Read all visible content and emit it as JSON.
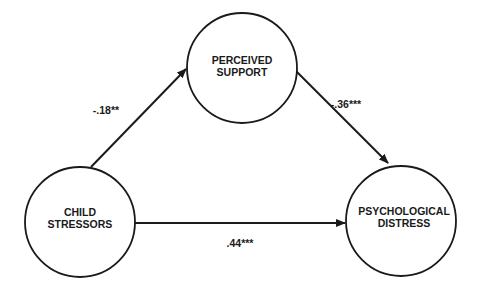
{
  "diagram": {
    "type": "mediation-path-model",
    "nodes": [
      {
        "id": "perceived_support",
        "line1": "PERCEIVED",
        "line2": "SUPPORT"
      },
      {
        "id": "child_stressors",
        "line1": "CHILD",
        "line2": "STRESSORS"
      },
      {
        "id": "psychological_distress",
        "line1": "PSYCHOLOGICAL",
        "line2": "DISTRESS"
      }
    ],
    "edges": [
      {
        "from": "child_stressors",
        "to": "perceived_support",
        "coefficient": "-.18**"
      },
      {
        "from": "perceived_support",
        "to": "psychological_distress",
        "coefficient": "-.36***"
      },
      {
        "from": "child_stressors",
        "to": "psychological_distress",
        "coefficient": ".44***"
      }
    ],
    "colors": {
      "stroke": "#1a1a1a",
      "background": "#ffffff"
    }
  }
}
